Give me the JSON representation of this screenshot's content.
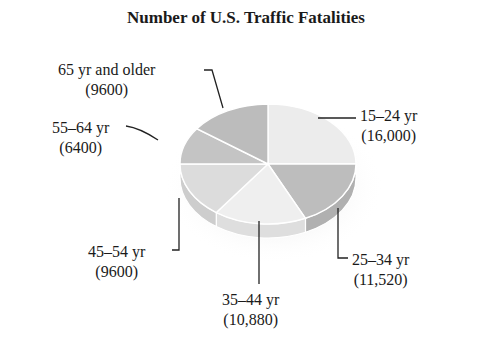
{
  "chart_data": {
    "type": "pie",
    "style": "3d",
    "title": "Number of  U.S. Traffic Fatalities",
    "categories": [
      "15–24 yr",
      "25–34 yr",
      "35–44 yr",
      "45–54 yr",
      "55–64 yr",
      "65 yr and older"
    ],
    "values": [
      16000,
      11520,
      10880,
      9600,
      6400,
      9600
    ],
    "labels": [
      {
        "name": "15–24 yr",
        "value": "(16,000)"
      },
      {
        "name": "25–34 yr",
        "value": "(11,520)"
      },
      {
        "name": "35–44 yr",
        "value": "(10,880)"
      },
      {
        "name": "45–54 yr",
        "value": "(9600)"
      },
      {
        "name": "55–64 yr",
        "value": "(6400)"
      },
      {
        "name": "65 yr and older",
        "value": "(9600)"
      }
    ],
    "colors": [
      "#ececec",
      "#bdbdbd",
      "#efefef",
      "#dcdcdc",
      "#c4c4c4",
      "#bcbcbc"
    ],
    "legend": "none"
  }
}
